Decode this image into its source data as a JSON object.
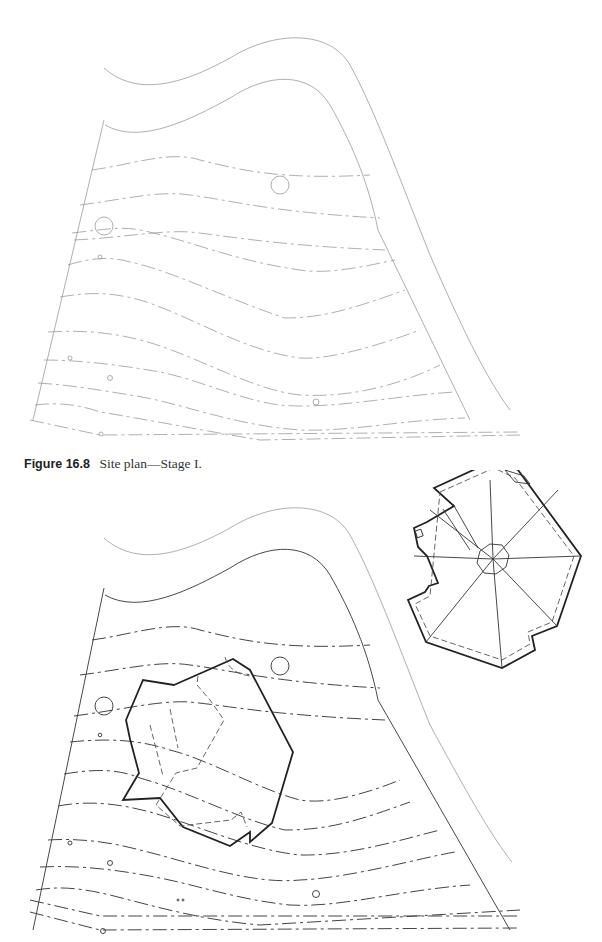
{
  "figure": {
    "number_label": "Figure 16.8",
    "caption_text": "Site plan—Stage I."
  },
  "plans": [
    {
      "name": "site-plan-stage-1",
      "features": [
        "road",
        "property-boundary",
        "contour-lines",
        "trees",
        "boundary-lines"
      ]
    },
    {
      "name": "site-plan-stage-1-with-house",
      "features": [
        "road",
        "property-boundary",
        "contour-lines",
        "trees",
        "house-footprint",
        "roof-plan"
      ]
    }
  ]
}
